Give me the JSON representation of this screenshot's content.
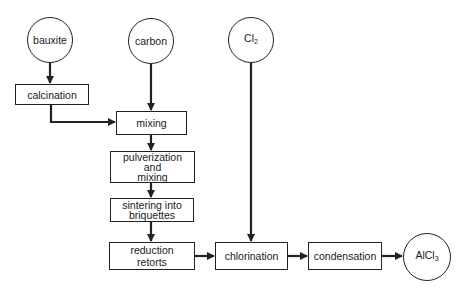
{
  "diagram": {
    "title": "",
    "type": "process flowchart",
    "stroke_color": "#222222",
    "nodes": {
      "bauxite": {
        "label": "bauxite",
        "shape": "circle"
      },
      "carbon": {
        "label": "carbon",
        "shape": "circle"
      },
      "cl2": {
        "label": "Cl",
        "subscript": "2",
        "shape": "circle"
      },
      "calcination": {
        "label": "calcination",
        "shape": "box"
      },
      "mixing": {
        "label": "mixing",
        "shape": "box"
      },
      "pulverization": {
        "line1": "pulverization",
        "line2": "and",
        "line3": "mixing",
        "shape": "box"
      },
      "sintering": {
        "line1": "sintering into",
        "line2": "briquettes",
        "shape": "box"
      },
      "reduction": {
        "line1": "reduction",
        "line2": "retorts",
        "shape": "box"
      },
      "chlorination": {
        "label": "chlorination",
        "shape": "box"
      },
      "condensation": {
        "label": "condensation",
        "shape": "box"
      },
      "alcl3": {
        "label": "AlCl",
        "subscript": "3",
        "shape": "circle"
      }
    },
    "edges": [
      {
        "from": "bauxite",
        "to": "calcination"
      },
      {
        "from": "calcination",
        "to": "mixing"
      },
      {
        "from": "carbon",
        "to": "mixing"
      },
      {
        "from": "mixing",
        "to": "pulverization"
      },
      {
        "from": "pulverization",
        "to": "sintering"
      },
      {
        "from": "sintering",
        "to": "reduction"
      },
      {
        "from": "reduction",
        "to": "chlorination"
      },
      {
        "from": "cl2",
        "to": "chlorination"
      },
      {
        "from": "chlorination",
        "to": "condensation"
      },
      {
        "from": "condensation",
        "to": "alcl3"
      }
    ]
  }
}
